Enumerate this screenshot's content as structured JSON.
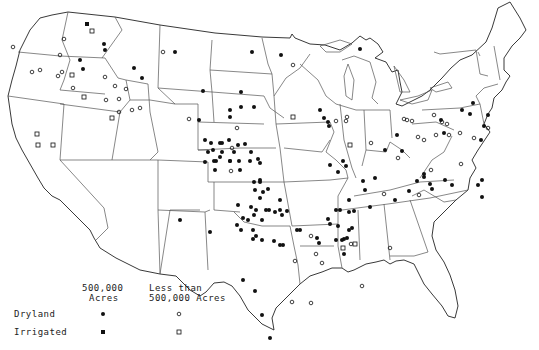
{
  "legend": {
    "col1_line1": "500,000",
    "col1_line2": "Acres",
    "col2_line1": "Less than",
    "col2_line2": "500,000 Acres",
    "row1": "Dryland",
    "row2": "Irrigated"
  },
  "symbols": {
    "dryland_large": "filled-circle",
    "dryland_small": "open-circle",
    "irrigated_large": "filled-square",
    "irrigated_small": "open-square"
  },
  "colors": {
    "ink": "#111111",
    "border": "#555555",
    "background": "#ffffff"
  },
  "markers": {
    "filled_circle": [
      [
        104,
        44
      ],
      [
        105,
        50
      ],
      [
        80,
        60
      ],
      [
        83,
        69
      ],
      [
        134,
        68
      ],
      [
        142,
        78
      ],
      [
        175,
        52
      ],
      [
        252,
        52
      ],
      [
        281,
        55
      ],
      [
        203,
        91
      ],
      [
        241,
        92
      ],
      [
        241,
        107
      ],
      [
        230,
        110
      ],
      [
        254,
        107
      ],
      [
        230,
        117
      ],
      [
        199,
        120
      ],
      [
        205,
        140
      ],
      [
        211,
        143
      ],
      [
        220,
        143
      ],
      [
        213,
        150
      ],
      [
        222,
        143
      ],
      [
        229,
        140
      ],
      [
        238,
        145
      ],
      [
        245,
        144
      ],
      [
        208,
        152
      ],
      [
        222,
        152
      ],
      [
        220,
        157
      ],
      [
        234,
        152
      ],
      [
        216,
        161
      ],
      [
        230,
        161
      ],
      [
        239,
        161
      ],
      [
        251,
        152
      ],
      [
        258,
        159
      ],
      [
        205,
        162
      ],
      [
        230,
        161
      ],
      [
        214,
        161
      ],
      [
        250,
        161
      ],
      [
        260,
        163
      ],
      [
        215,
        170
      ],
      [
        240,
        170
      ],
      [
        260,
        180
      ],
      [
        254,
        182
      ],
      [
        360,
        49
      ],
      [
        320,
        110
      ],
      [
        324,
        118
      ],
      [
        328,
        122
      ],
      [
        329,
        126
      ],
      [
        330,
        165
      ],
      [
        343,
        161
      ],
      [
        346,
        166
      ],
      [
        338,
        172
      ],
      [
        260,
        182
      ],
      [
        255,
        190
      ],
      [
        263,
        192
      ],
      [
        268,
        189
      ],
      [
        260,
        198
      ],
      [
        238,
        205
      ],
      [
        251,
        207
      ],
      [
        256,
        210
      ],
      [
        269,
        210
      ],
      [
        266,
        210
      ],
      [
        280,
        210
      ],
      [
        287,
        211
      ],
      [
        280,
        200
      ],
      [
        248,
        220
      ],
      [
        262,
        220
      ],
      [
        243,
        218
      ],
      [
        254,
        215
      ],
      [
        275,
        212
      ],
      [
        282,
        215
      ],
      [
        237,
        225
      ],
      [
        241,
        230
      ],
      [
        253,
        230
      ],
      [
        253,
        239
      ],
      [
        256,
        236
      ],
      [
        262,
        240
      ],
      [
        274,
        241
      ],
      [
        280,
        245
      ],
      [
        283,
        245
      ],
      [
        297,
        230
      ],
      [
        300,
        230
      ],
      [
        317,
        238
      ],
      [
        319,
        243
      ],
      [
        328,
        219
      ],
      [
        330,
        224
      ],
      [
        338,
        226
      ],
      [
        336,
        210
      ],
      [
        336,
        240
      ],
      [
        347,
        238
      ],
      [
        349,
        230
      ],
      [
        344,
        239
      ],
      [
        349,
        212
      ],
      [
        340,
        210
      ],
      [
        349,
        200
      ],
      [
        354,
        211
      ],
      [
        363,
        181
      ],
      [
        375,
        178
      ],
      [
        365,
        190
      ],
      [
        352,
        228
      ],
      [
        370,
        207
      ],
      [
        385,
        150
      ],
      [
        462,
        110
      ],
      [
        473,
        103
      ],
      [
        470,
        114
      ],
      [
        488,
        115
      ],
      [
        484,
        126
      ],
      [
        441,
        120
      ],
      [
        444,
        133
      ],
      [
        481,
        140
      ],
      [
        397,
        135
      ],
      [
        402,
        151
      ],
      [
        417,
        181
      ],
      [
        424,
        177
      ],
      [
        395,
        200
      ],
      [
        409,
        191
      ],
      [
        432,
        189
      ],
      [
        430,
        184
      ],
      [
        424,
        174
      ],
      [
        445,
        180
      ],
      [
        452,
        185
      ],
      [
        478,
        185
      ],
      [
        482,
        180
      ],
      [
        482,
        197
      ],
      [
        342,
        240
      ],
      [
        344,
        254
      ],
      [
        243,
        280
      ],
      [
        255,
        291
      ],
      [
        262,
        315
      ],
      [
        270,
        338
      ],
      [
        180,
        220
      ],
      [
        210,
        232
      ]
    ],
    "open_circle": [
      [
        13,
        47
      ],
      [
        64,
        39
      ],
      [
        32,
        72
      ],
      [
        40,
        70
      ],
      [
        60,
        55
      ],
      [
        58,
        76
      ],
      [
        62,
        72
      ],
      [
        73,
        88
      ],
      [
        105,
        77
      ],
      [
        106,
        100
      ],
      [
        115,
        86
      ],
      [
        119,
        112
      ],
      [
        126,
        89
      ],
      [
        132,
        110
      ],
      [
        140,
        108
      ],
      [
        119,
        99
      ],
      [
        163,
        52
      ],
      [
        189,
        119
      ],
      [
        293,
        65
      ],
      [
        237,
        128
      ],
      [
        232,
        148
      ],
      [
        231,
        171
      ],
      [
        347,
        117
      ],
      [
        351,
        244
      ],
      [
        316,
        254
      ],
      [
        295,
        261
      ],
      [
        292,
        302
      ],
      [
        322,
        263
      ],
      [
        311,
        236
      ],
      [
        311,
        303
      ],
      [
        424,
        140
      ],
      [
        431,
        170
      ],
      [
        384,
        194
      ],
      [
        419,
        195
      ],
      [
        362,
        286
      ],
      [
        434,
        115
      ],
      [
        442,
        122
      ],
      [
        447,
        124
      ],
      [
        371,
        143
      ],
      [
        404,
        119
      ],
      [
        418,
        137
      ],
      [
        460,
        133
      ],
      [
        474,
        138
      ],
      [
        449,
        135
      ],
      [
        336,
        121
      ],
      [
        346,
        121
      ],
      [
        390,
        248
      ],
      [
        398,
        158
      ],
      [
        407,
        120
      ],
      [
        412,
        121
      ],
      [
        436,
        135
      ],
      [
        461,
        164
      ],
      [
        488,
        128
      ]
    ],
    "filled_square": [
      [
        87,
        24
      ]
    ],
    "open_square": [
      [
        92,
        31
      ],
      [
        72,
        75
      ],
      [
        84,
        97
      ],
      [
        112,
        118
      ],
      [
        37,
        134
      ],
      [
        38,
        145
      ],
      [
        53,
        145
      ],
      [
        293,
        117
      ],
      [
        350,
        145
      ],
      [
        343,
        248
      ],
      [
        355,
        244
      ]
    ]
  }
}
